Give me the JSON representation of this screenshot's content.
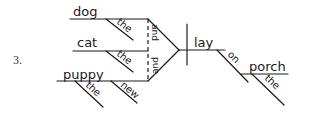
{
  "diagram": {
    "item_number": "3.",
    "subjects": [
      {
        "word": "dog",
        "modifiers": [
          "the"
        ]
      },
      {
        "word": "cat",
        "modifiers": [
          "the"
        ]
      },
      {
        "word": "puppy",
        "modifiers": [
          "the",
          "new"
        ]
      }
    ],
    "conjunctions": [
      "and",
      "and"
    ],
    "verb": "lay",
    "prepositional_phrase": {
      "preposition": "on",
      "object": "porch",
      "object_modifiers": [
        "the"
      ]
    },
    "colors": {
      "ink": "#1a1a1a",
      "background": "#ffffff"
    }
  }
}
